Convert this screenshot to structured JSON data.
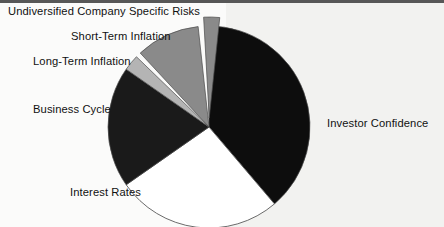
{
  "figure": {
    "background": "#fdfdfd",
    "outline_color": "#555555"
  },
  "labels": {
    "undiversified": "Undiversified Company Specific Risks",
    "short_term": "Short-Term Inflation",
    "long_term": "Long-Term Inflation",
    "business_cycle": "Business Cycle",
    "interest_rates": "Interest Rates",
    "investor_confidence": "Investor Confidence"
  },
  "chart_data": {
    "type": "pie",
    "title": "",
    "legend": "none",
    "labels_position": "outside-callout",
    "start_angle_deg": 90,
    "direction": "clockwise",
    "categories": [
      "Investor Confidence",
      "Interest Rates",
      "Business Cycle",
      "Long-Term Inflation",
      "Short-Term Inflation",
      "Undiversified Company Specific Risks"
    ],
    "values": [
      38,
      26,
      19,
      2.5,
      10,
      2.5
    ],
    "units": "percent",
    "colors": [
      "#0d0d0d",
      "#ffffff",
      "#1a1a1a",
      "#b4b4b4",
      "#8a8a8a",
      "#8a8a8a"
    ],
    "exploded": [
      false,
      false,
      false,
      false,
      false,
      true
    ],
    "slices": [
      {
        "name": "Investor Confidence",
        "value": 38,
        "color": "#0d0d0d",
        "exploded": false
      },
      {
        "name": "Interest Rates",
        "value": 26,
        "color": "#ffffff",
        "exploded": false
      },
      {
        "name": "Business Cycle",
        "value": 19,
        "color": "#1a1a1a",
        "exploded": false
      },
      {
        "name": "Long-Term Inflation",
        "value": 2.5,
        "color": "#b4b4b4",
        "exploded": false
      },
      {
        "name": "Short-Term Inflation",
        "value": 10,
        "color": "#8a8a8a",
        "exploded": false
      },
      {
        "name": "Undiversified Company Specific Risks",
        "value": 2.5,
        "color": "#8a8a8a",
        "exploded": true
      }
    ]
  }
}
